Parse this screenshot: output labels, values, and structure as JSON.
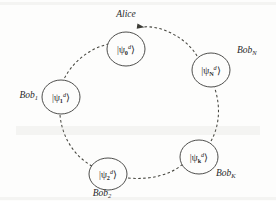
{
  "figure": {
    "title_label": "Alice",
    "background_color": "#fdfdfc",
    "line_color": "#46463f",
    "node_stroke_color": "#3a3a38",
    "ket_open": "|",
    "ket_close": "⟩",
    "psi_symbol": "ψ",
    "superscript": "d",
    "nodes": [
      {
        "id": "psi-0",
        "state_subscript": "0",
        "party_label": "Alice",
        "party_sub": "",
        "cx": 126,
        "cy": 49,
        "rx": 19,
        "ry": 17,
        "label_x": 126,
        "label_y": 17,
        "label_anchor": "middle"
      },
      {
        "id": "psi-N",
        "state_subscript": "N",
        "party_label": "Bob",
        "party_sub": "N",
        "cx": 211,
        "cy": 70,
        "rx": 19,
        "ry": 17,
        "label_x": 237,
        "label_y": 53,
        "label_anchor": "start"
      },
      {
        "id": "psi-1",
        "state_subscript": "1",
        "party_label": "Bob",
        "party_sub": "1",
        "cx": 61,
        "cy": 97,
        "rx": 19,
        "ry": 17,
        "label_x": 38,
        "label_y": 98,
        "label_anchor": "end"
      },
      {
        "id": "psi-2",
        "state_subscript": "2",
        "party_label": "Bob",
        "party_sub": "2",
        "cx": 108,
        "cy": 174,
        "rx": 19,
        "ry": 16,
        "label_x": 102,
        "label_y": 196,
        "label_anchor": "middle"
      },
      {
        "id": "psi-k",
        "state_subscript": "k",
        "party_label": "Bob",
        "party_sub": "K",
        "cx": 199,
        "cy": 157,
        "rx": 19,
        "ry": 17,
        "label_x": 216,
        "label_y": 176,
        "label_anchor": "start"
      }
    ],
    "arcs": [
      {
        "id": "arc-N-to-0",
        "from": "psi-N",
        "to": "psi-0",
        "path": "M 197 56 C 186 37 160 25 143 27",
        "arrow_at": "end",
        "arrow_x": 144.5,
        "arrow_y": 27.2,
        "arrow_angle": 188
      },
      {
        "id": "arc-0-to-1",
        "from": "psi-0",
        "to": "psi-1",
        "path": "M 109 44 C 89 48 72 63 64 79",
        "arrow_at": "end",
        "arrow_x": 63.4,
        "arrow_y": 80.6,
        "arrow_angle": 114
      },
      {
        "id": "arc-1-to-2",
        "from": "psi-1",
        "to": "psi-2",
        "path": "M 60 115 C 62 137 74 156 92 166",
        "arrow_at": "end",
        "arrow_x": 93.6,
        "arrow_y": 166.8,
        "arrow_angle": 30
      },
      {
        "id": "arc-2-to-k",
        "from": "psi-2",
        "to": "psi-k",
        "path": "M 128 178 C 151 180 170 175 183 164",
        "arrow_at": "end",
        "arrow_x": 184.2,
        "arrow_y": 163.0,
        "arrow_angle": -40
      },
      {
        "id": "arc-k-to-N",
        "from": "psi-k",
        "to": "psi-N",
        "path": "M 211 141 C 219 127 221 108 215 89",
        "arrow_at": "end",
        "arrow_x": 214.6,
        "arrow_y": 87.4,
        "arrow_angle": -107
      }
    ]
  }
}
